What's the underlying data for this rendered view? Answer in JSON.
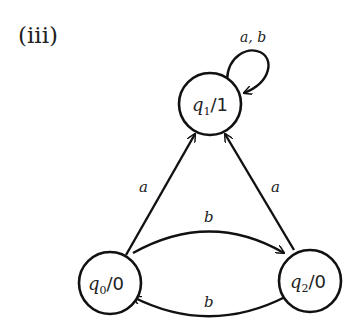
{
  "figure": {
    "label": "(iii)"
  },
  "states": [
    {
      "id": "q0",
      "name": "q",
      "subscript": "0",
      "output": "/0"
    },
    {
      "id": "q1",
      "name": "q",
      "subscript": "1",
      "output": "/1"
    },
    {
      "id": "q2",
      "name": "q",
      "subscript": "2",
      "output": "/0"
    }
  ],
  "transitions": [
    {
      "from": "q1",
      "to": "q1",
      "label": "a, b"
    },
    {
      "from": "q0",
      "to": "q1",
      "label": "a"
    },
    {
      "from": "q2",
      "to": "q1",
      "label": "a"
    },
    {
      "from": "q0",
      "to": "q2",
      "label": "b"
    },
    {
      "from": "q2",
      "to": "q0",
      "label": "b"
    }
  ],
  "colors": {
    "stroke": "#111111",
    "background": "#ffffff"
  }
}
